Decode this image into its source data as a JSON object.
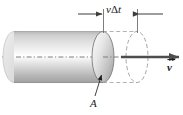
{
  "figure": {
    "name": "fluid-volume-cylinder-flux-diagram",
    "width": 183,
    "height": 115,
    "background_color": "#ffffff"
  },
  "labels": {
    "displacement": {
      "text_velocity": "v",
      "text_delta": "Δ",
      "text_time": "t",
      "full": "vΔt"
    },
    "area": "A",
    "velocity": "v"
  },
  "colors": {
    "stroke": "#1a1a1a",
    "cylinder_light": "#ffffff",
    "cylinder_mid": "#d6d6d6",
    "cylinder_dark": "#a8a8a8",
    "cap_light": "#f2f2f2",
    "cap_dark": "#9a9a9a",
    "dashed": "#999999",
    "axis": "#777777",
    "arrow_fill": "#4d4d4d"
  },
  "geometry": {
    "cylinder_left_x": 14,
    "cylinder_right_x": 103,
    "cylinder_top_y": 31,
    "cylinder_bottom_y": 82,
    "cap_rx": 11,
    "cap_ry": 25.5,
    "axis_y": 57,
    "ghost_cap_cx": 137,
    "dimension_line_y": 14,
    "velocity_arrow_start_x": 121,
    "velocity_arrow_end_x": 178
  },
  "annotations": {
    "dimension_label": "vΔt",
    "area_leader_from": "A",
    "velocity_vector": "v"
  }
}
